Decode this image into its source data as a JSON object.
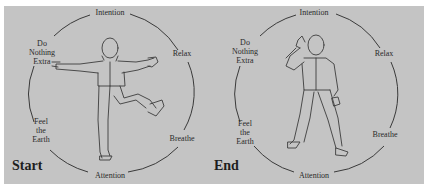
{
  "figure": {
    "panels": [
      {
        "id": "start",
        "title": "Start",
        "labels": {
          "top": "Intention",
          "right_upper": "Relax",
          "right_lower": "Breathe",
          "bottom": "Attention",
          "left_upper": [
            "Do",
            "Nothing",
            "Extra"
          ],
          "left_lower": [
            "Feel",
            "the",
            "Earth"
          ]
        },
        "figure_pose": "arms outstretched, right leg raised"
      },
      {
        "id": "end",
        "title": "End",
        "labels": {
          "top": "Intention",
          "right_upper": "Relax",
          "right_lower": "Breathe",
          "bottom": "Attention",
          "left_upper": [
            "Do",
            "Nothing",
            "Extra"
          ],
          "left_lower": [
            "Feel",
            "the",
            "Earth"
          ]
        },
        "figure_pose": "hand raised to head, standing"
      }
    ],
    "colors": {
      "background": "#c4c4c4",
      "ink": "#2a2a2a"
    }
  }
}
